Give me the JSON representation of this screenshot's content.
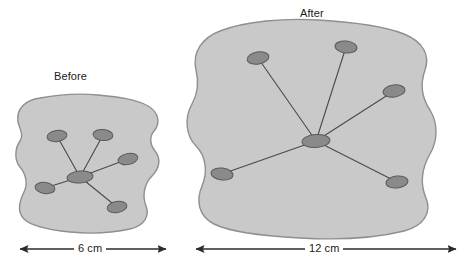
{
  "figure": {
    "type": "comparison-diagram"
  },
  "panels": [
    {
      "id": "before",
      "title": "Before",
      "dimension_label": "6 cm",
      "dimension_value": 6,
      "dimension_unit": "cm",
      "node_count": 6,
      "branch_count": 5
    },
    {
      "id": "after",
      "title": "After",
      "dimension_label": "12 cm",
      "dimension_value": 12,
      "dimension_unit": "cm",
      "node_count": 6,
      "branch_count": 5
    }
  ],
  "colors": {
    "background": "#ffffff",
    "blob_fill": "#c9c9c9",
    "blob_stroke": "#8f8f8f",
    "node_fill": "#8a8a8a",
    "node_stroke": "#5a5a5a",
    "branch_line": "#4a4a4a",
    "dimension_line": "#2b2b2b",
    "text": "#1a1a1a"
  },
  "geometry": {
    "before": {
      "blob_path": "M 18 122 C 16 108 26 100 40 98 C 56 95 78 93 98 95 C 118 97 136 99 148 106 C 160 113 160 124 154 131 C 149 137 150 145 155 151 C 161 158 160 168 152 176 C 144 184 142 196 146 206 C 150 216 144 226 130 229 C 112 233 90 234 70 232 C 50 230 32 227 24 219 C 16 211 20 200 24 192 C 28 184 26 174 20 167 C 14 160 15 148 20 141 C 24 135 20 130 18 122 Z",
      "center": {
        "x": 80,
        "y": 177
      },
      "nodes": [
        {
          "x": 57,
          "y": 136,
          "rx": 10,
          "ry": 5.5,
          "rot": -8
        },
        {
          "x": 103,
          "y": 135,
          "rx": 10,
          "ry": 5.5,
          "rot": 5
        },
        {
          "x": 128,
          "y": 159,
          "rx": 10,
          "ry": 5.5,
          "rot": -12
        },
        {
          "x": 45,
          "y": 188,
          "rx": 10,
          "ry": 5.5,
          "rot": 8
        },
        {
          "x": 117,
          "y": 207,
          "rx": 10,
          "ry": 5.5,
          "rot": -10
        }
      ],
      "center_node": {
        "rx": 13,
        "ry": 6,
        "rot": -5
      },
      "dim_line": {
        "x1": 20,
        "x2": 166,
        "y": 249
      }
    },
    "after": {
      "blob_path": "M 196 70 C 192 52 202 38 220 31 C 246 21 284 18 318 20 C 352 22 384 26 404 34 C 424 42 430 56 425 70 C 420 84 422 98 430 110 C 438 123 438 140 430 154 C 422 168 420 184 426 198 C 432 212 424 226 404 231 C 376 238 336 240 300 238 C 264 236 230 232 214 224 C 198 216 196 200 202 186 C 208 172 206 156 196 146 C 186 136 184 118 192 104 C 198 93 199 82 196 70 Z",
      "center": {
        "x": 316,
        "y": 141
      },
      "nodes": [
        {
          "x": 258,
          "y": 58,
          "rx": 11,
          "ry": 6,
          "rot": -10
        },
        {
          "x": 346,
          "y": 47,
          "rx": 11,
          "ry": 6,
          "rot": 6
        },
        {
          "x": 394,
          "y": 91,
          "rx": 11,
          "ry": 6,
          "rot": -8
        },
        {
          "x": 222,
          "y": 174,
          "rx": 11,
          "ry": 6,
          "rot": 7
        },
        {
          "x": 397,
          "y": 182,
          "rx": 11,
          "ry": 6,
          "rot": -7
        }
      ],
      "center_node": {
        "rx": 14,
        "ry": 6.5,
        "rot": -4
      },
      "dim_line": {
        "x1": 196,
        "x2": 456,
        "y": 249
      }
    }
  }
}
